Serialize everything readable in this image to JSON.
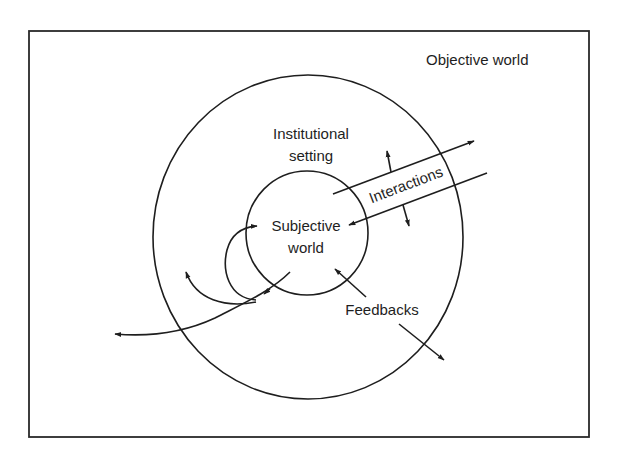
{
  "diagram": {
    "type": "nested-spheres",
    "colors": {
      "stroke": "#1e1e1e",
      "background": "#ffffff",
      "text": "#1e1e1e"
    },
    "regions": {
      "outer": {
        "label": "Objective world"
      },
      "middle": {
        "label_line1": "Institutional",
        "label_line2": "setting"
      },
      "inner": {
        "label_line1": "Subjective",
        "label_line2": "world"
      }
    },
    "flows": {
      "interactions": {
        "label": "Interactions"
      },
      "feedbacks": {
        "label": "Feedbacks"
      }
    }
  }
}
